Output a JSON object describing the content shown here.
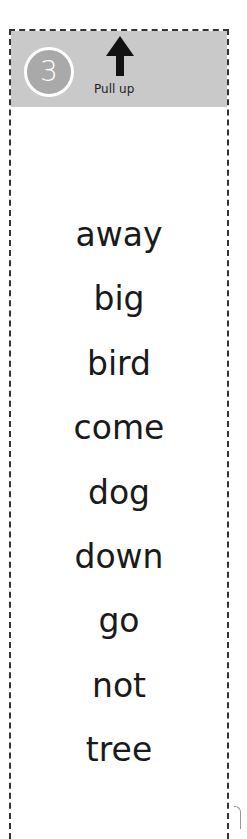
{
  "header": {
    "step_number": "3",
    "instruction": "Pull up",
    "arrow_icon": "arrow-up-icon"
  },
  "words": [
    "away",
    "big",
    "bird",
    "come",
    "dog",
    "down",
    "go",
    "not",
    "tree"
  ],
  "colors": {
    "header_band": "#c9c9c9",
    "badge_fill": "#a9a9a9",
    "badge_ring": "#ffffff",
    "text": "#1a1a1a",
    "dash_border": "#333333"
  }
}
